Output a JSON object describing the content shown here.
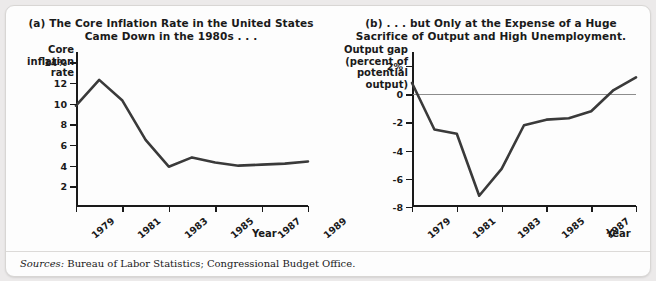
{
  "figure": {
    "sources_label": "Sources:",
    "sources_text": " Bureau of Labor Statistics; Congressional Budget Office.",
    "frame_color": "#fdfdfd",
    "line_color": "#3a3a3a",
    "axis_color": "#1a1a1a"
  },
  "panel_a": {
    "title_line1": "(a) The Core Inflation Rate in the United States",
    "title_line2": "Came Down in the 1980s . . .",
    "y_axis_label": "Core inflation rate",
    "x_axis_label": "Year"
  },
  "panel_b": {
    "title_line1": "(b) . . . but Only at the Expense of a Huge",
    "title_line2": "Sacrifice of Output and High Unemployment.",
    "y_axis_label": "Output gap (percent of potential output)",
    "x_axis_label": "Year"
  },
  "chart_data": [
    {
      "type": "line",
      "panel": "a",
      "title": "(a) The Core Inflation Rate in the United States Came Down in the 1980s . . .",
      "xlabel": "Year",
      "ylabel": "Core inflation rate",
      "x": [
        1979,
        1980,
        1981,
        1982,
        1983,
        1984,
        1985,
        1986,
        1987,
        1988,
        1989
      ],
      "values": [
        9.8,
        12.3,
        10.3,
        6.5,
        3.9,
        4.8,
        4.3,
        4.0,
        4.1,
        4.2,
        4.4
      ],
      "ylim": [
        0,
        15
      ],
      "xlim": [
        1979,
        1989
      ],
      "ytick_values": [
        14,
        12,
        10,
        8,
        6,
        4,
        2
      ],
      "ytick_labels": [
        "14%",
        "12",
        "10",
        "8",
        "6",
        "4",
        "2"
      ],
      "xtick_values": [
        1979,
        1981,
        1983,
        1985,
        1987,
        1989
      ],
      "xtick_labels": [
        "1979",
        "1981",
        "1983",
        "1985",
        "1987",
        "1989"
      ],
      "grid": false,
      "legend": "none"
    },
    {
      "type": "line",
      "panel": "b",
      "title": "(b) . . . but Only at the Expense of a Huge Sacrifice of Output and High Unemployment.",
      "xlabel": "Year",
      "ylabel": "Output gap (percent of potential output)",
      "x": [
        1979,
        1980,
        1981,
        1982,
        1983,
        1984,
        1985,
        1986,
        1987,
        1988,
        1989
      ],
      "values": [
        0.8,
        -2.5,
        -2.8,
        -7.2,
        -5.3,
        -2.2,
        -1.8,
        -1.7,
        -1.2,
        0.3,
        1.2
      ],
      "ylim": [
        -8,
        3
      ],
      "xlim": [
        1979,
        1989
      ],
      "ytick_values": [
        2,
        0,
        -2,
        -4,
        -6,
        -8
      ],
      "ytick_labels": [
        "2%",
        "0",
        "-2",
        "-4",
        "-6",
        "-8"
      ],
      "xtick_values": [
        1979,
        1981,
        1983,
        1985,
        1987,
        1989
      ],
      "xtick_labels": [
        "1979",
        "1981",
        "1983",
        "1985",
        "1987",
        "1989"
      ],
      "zero_line": true,
      "grid": false,
      "legend": "none"
    }
  ]
}
